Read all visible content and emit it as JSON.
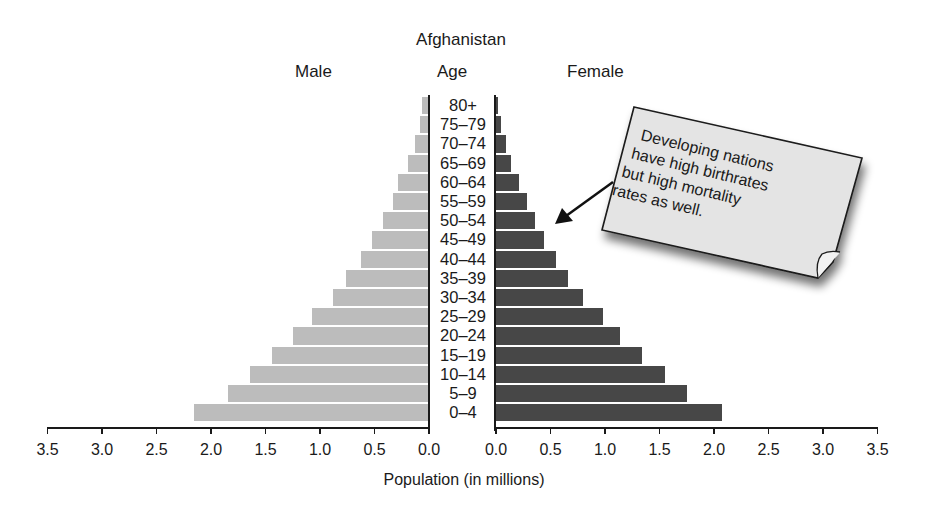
{
  "chart_data": {
    "type": "bar",
    "subtype": "population-pyramid",
    "title": "Afghanistan",
    "left_header": "Male",
    "center_header": "Age",
    "right_header": "Female",
    "xlabel": "Population (in millions)",
    "ylabel": "Age",
    "xlim": [
      0,
      3.5
    ],
    "x_ticks": [
      "0.0",
      "0.5",
      "1.0",
      "1.5",
      "2.0",
      "2.5",
      "3.0",
      "3.5"
    ],
    "grid": false,
    "categories": [
      "80+",
      "75–79",
      "70–74",
      "65–69",
      "60–64",
      "55–59",
      "50–54",
      "45–49",
      "40–44",
      "35–39",
      "30–34",
      "25–29",
      "20–24",
      "15–19",
      "10–14",
      "5–9",
      "0–4"
    ],
    "series": [
      {
        "name": "Male",
        "color": "#bcbcbc",
        "values": [
          0.06,
          0.08,
          0.13,
          0.19,
          0.28,
          0.33,
          0.42,
          0.52,
          0.62,
          0.76,
          0.88,
          1.07,
          1.25,
          1.44,
          1.64,
          1.84,
          2.16
        ]
      },
      {
        "name": "Female",
        "color": "#474747",
        "values": [
          0.02,
          0.05,
          0.09,
          0.14,
          0.21,
          0.28,
          0.36,
          0.44,
          0.55,
          0.66,
          0.8,
          0.98,
          1.14,
          1.34,
          1.55,
          1.75,
          2.07
        ]
      }
    ],
    "annotation": {
      "text_lines": [
        "Developing nations",
        "have high birthrates",
        "but high mortality",
        "rates as well."
      ],
      "points_to": "Female bars around ages 45–54"
    }
  }
}
